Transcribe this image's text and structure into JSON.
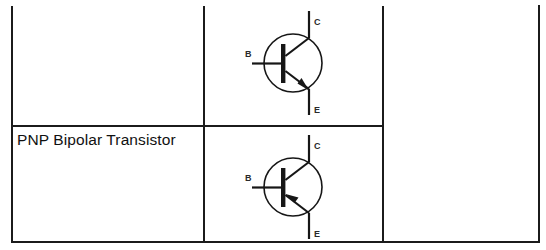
{
  "table": {
    "rows": [
      {
        "label": "",
        "symbol": {
          "name": "npn-bipolar-transistor-symbol",
          "type": "npn",
          "terminals": [
            {
              "id": "C",
              "label": "C",
              "name": "collector"
            },
            {
              "id": "B",
              "label": "B",
              "name": "base"
            },
            {
              "id": "E",
              "label": "E",
              "name": "emitter"
            }
          ]
        },
        "notes": ""
      },
      {
        "label": "PNP Bipolar Transistor",
        "symbol": {
          "name": "pnp-bipolar-transistor-symbol",
          "type": "pnp",
          "terminals": [
            {
              "id": "C",
              "label": "C",
              "name": "collector"
            },
            {
              "id": "B",
              "label": "B",
              "name": "base"
            },
            {
              "id": "E",
              "label": "E",
              "name": "emitter"
            }
          ]
        },
        "notes": ""
      }
    ]
  },
  "colors": {
    "rule": "#1b1b1b",
    "symbol_stroke": "#161616",
    "text": "#111111",
    "terminal_label": "#2a2a2a",
    "background": "#ffffff"
  }
}
